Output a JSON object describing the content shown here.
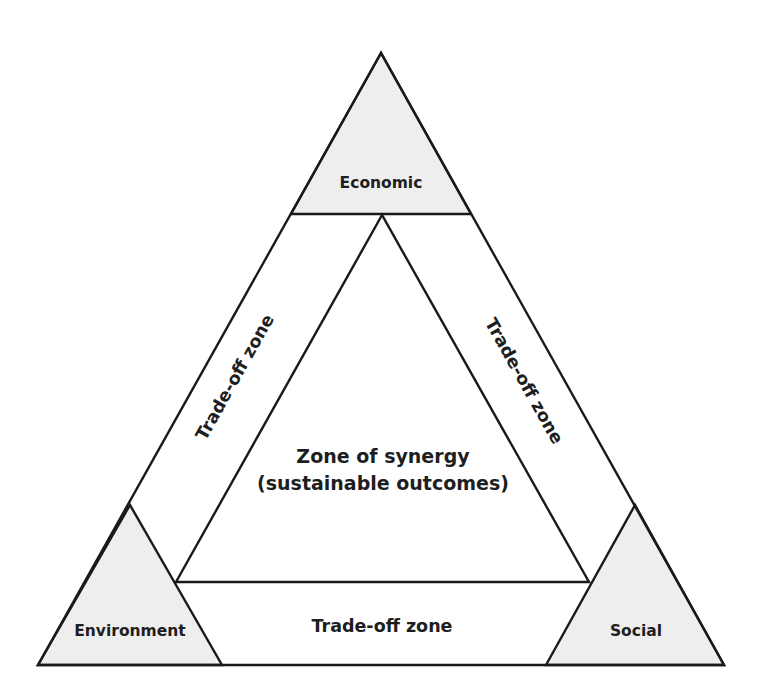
{
  "diagram": {
    "type": "triangle-framework",
    "colors": {
      "corner_fill": "#eeeeee",
      "stroke": "#1a1a1a",
      "text": "#1e1e1e",
      "background": "#ffffff"
    },
    "corners": {
      "top": {
        "label": "Economic"
      },
      "bottom_left": {
        "label": "Environment"
      },
      "bottom_right": {
        "label": "Social"
      }
    },
    "zones": {
      "left": {
        "label": "Trade-off zone"
      },
      "right": {
        "label": "Trade-off zone"
      },
      "bottom": {
        "label": "Trade-off zone"
      }
    },
    "center": {
      "line1": "Zone of synergy",
      "line2": "(sustainable outcomes)"
    }
  }
}
